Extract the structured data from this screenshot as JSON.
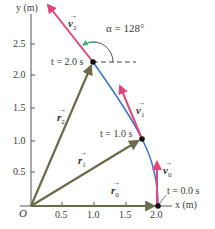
{
  "diagram": {
    "axes": {
      "x_label": "x (m)",
      "y_label": "y (m)",
      "origin_label": "O",
      "x_ticks": [
        "0.5",
        "1.0",
        "1.5",
        "2.0"
      ],
      "y_ticks": [
        "0.5",
        "1.0",
        "1.5",
        "2.0",
        "2.5"
      ]
    },
    "points": [
      {
        "time_label": "t = 0.0 s",
        "x": 2.0,
        "y": 0.0
      },
      {
        "time_label": "t = 1.0 s",
        "x": 1.75,
        "y": 1.03
      },
      {
        "time_label": "t = 2.0 s",
        "x": 0.98,
        "y": 2.2
      }
    ],
    "position_vectors": [
      {
        "label": "r",
        "subscript": "0"
      },
      {
        "label": "r",
        "subscript": "1"
      },
      {
        "label": "r",
        "subscript": "2"
      }
    ],
    "velocity_vectors": [
      {
        "label": "v",
        "subscript": "0"
      },
      {
        "label": "v",
        "subscript": "1"
      },
      {
        "label": "v",
        "subscript": "2"
      }
    ],
    "angle_label": "α = 128°",
    "colors": {
      "trajectory": "#3a78c4",
      "velocity": "#e0457b",
      "position": "#6b6a4a",
      "axes": "#555555",
      "angle_arrow": "#3cb371",
      "point": "#111111"
    }
  }
}
